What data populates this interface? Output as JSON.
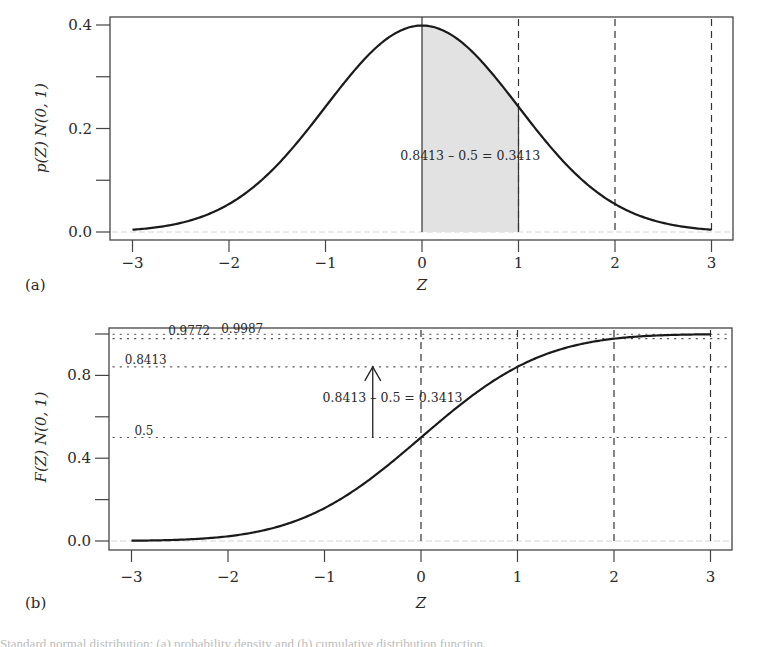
{
  "chart_data": [
    {
      "id": "a",
      "type": "area",
      "panel_label": "(a)",
      "title": "",
      "xlabel": "Z",
      "ylabel": "p(Z) N(0, 1)",
      "xlim": [
        -3,
        3
      ],
      "ylim": [
        0,
        0.4
      ],
      "xticks": [
        -3,
        -2,
        -1,
        0,
        1,
        2,
        3
      ],
      "xtick_labels": [
        "−3",
        "−2",
        "−1",
        "0",
        "1",
        "2",
        "3"
      ],
      "yticks": [
        0,
        0.1,
        0.2,
        0.3,
        0.4
      ],
      "ytick_labels": [
        "0.0",
        "",
        "0.2",
        "",
        "0.4"
      ],
      "series": [
        {
          "name": "standard normal density",
          "x": [
            -3,
            -2.5,
            -2,
            -1.5,
            -1,
            -0.5,
            0,
            0.5,
            1,
            1.5,
            2,
            2.5,
            3
          ],
          "values": [
            0.0044,
            0.0175,
            0.054,
            0.1295,
            0.242,
            0.3521,
            0.3989,
            0.3521,
            0.242,
            0.1295,
            0.054,
            0.0175,
            0.0044
          ]
        }
      ],
      "shaded_region": {
        "from": 0,
        "to": 1,
        "color": "#e2e2e2"
      },
      "vertical_lines": [
        {
          "x": 0,
          "style": "solid"
        },
        {
          "x": 1,
          "style": "dashed"
        },
        {
          "x": 2,
          "style": "dashed"
        },
        {
          "x": 3,
          "style": "dashed"
        }
      ],
      "annotation": {
        "text": "0.8413 – 0.5 = 0.3413",
        "x": 0.5,
        "y": 0.14
      },
      "grid": false
    },
    {
      "id": "b",
      "type": "line",
      "panel_label": "(b)",
      "title": "",
      "xlabel": "Z",
      "ylabel": "F(Z) N(0, 1)",
      "xlim": [
        -3,
        3
      ],
      "ylim": [
        0,
        1
      ],
      "xticks": [
        -3,
        -2,
        -1,
        0,
        1,
        2,
        3
      ],
      "xtick_labels": [
        "−3",
        "−2",
        "−1",
        "0",
        "1",
        "2",
        "3"
      ],
      "yticks": [
        0,
        0.2,
        0.4,
        0.6,
        0.8,
        1.0
      ],
      "ytick_labels": [
        "0.0",
        "",
        "0.4",
        "",
        "0.8",
        ""
      ],
      "series": [
        {
          "name": "standard normal CDF",
          "x": [
            -3,
            -2.5,
            -2,
            -1.5,
            -1,
            -0.5,
            0,
            0.5,
            1,
            1.5,
            2,
            2.5,
            3
          ],
          "values": [
            0.0013,
            0.0062,
            0.0228,
            0.0668,
            0.1587,
            0.3085,
            0.5,
            0.6915,
            0.8413,
            0.9332,
            0.9772,
            0.9938,
            0.9987
          ]
        }
      ],
      "vertical_lines": [
        {
          "x": 0,
          "style": "dashed"
        },
        {
          "x": 1,
          "style": "dashed"
        },
        {
          "x": 2,
          "style": "dashed"
        },
        {
          "x": 3,
          "style": "dashed"
        }
      ],
      "horizontal_lines": [
        {
          "y": 0.9987,
          "label": "0.9987",
          "label_x": -2.07,
          "label_dy": -1
        },
        {
          "y": 0.9772,
          "label": "0.9772",
          "label_x": -2.62,
          "label_dy": -4
        },
        {
          "y": 0.8413,
          "label": "0.8413",
          "label_x": -3.07,
          "label_dy": -3
        },
        {
          "y": 0.5,
          "label": "0.5",
          "label_x": -2.97,
          "label_dy": -3
        }
      ],
      "arrow": {
        "x": -0.5,
        "from": 0.5,
        "to": 0.8413
      },
      "annotation": {
        "text": "0.8413 – 0.5 = 0.3413",
        "x": -1.02,
        "y": 0.67
      },
      "grid": false
    }
  ],
  "caption_partial": "Standard normal distribution: (a) probability density and (b) cumulative distribution function."
}
